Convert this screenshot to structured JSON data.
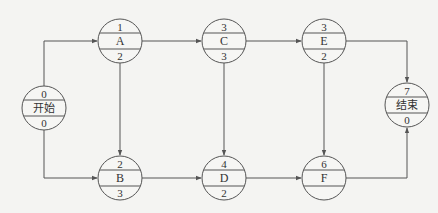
{
  "diagram": {
    "type": "activity-on-node network",
    "nodes": [
      {
        "id": "start",
        "label": "开始",
        "top": "0",
        "bottom": "0",
        "cx": 44,
        "cy": 108
      },
      {
        "id": "A",
        "label": "A",
        "top": "1",
        "bottom": "2",
        "cx": 120,
        "cy": 41
      },
      {
        "id": "B",
        "label": "B",
        "top": "2",
        "bottom": "3",
        "cx": 120,
        "cy": 178
      },
      {
        "id": "C",
        "label": "C",
        "top": "3",
        "bottom": "3",
        "cx": 224,
        "cy": 41
      },
      {
        "id": "D",
        "label": "D",
        "top": "4",
        "bottom": "2",
        "cx": 224,
        "cy": 178
      },
      {
        "id": "E",
        "label": "E",
        "top": "3",
        "bottom": "2",
        "cx": 324,
        "cy": 41
      },
      {
        "id": "F",
        "label": "F",
        "top": "6",
        "bottom": "",
        "cx": 324,
        "cy": 178
      },
      {
        "id": "end",
        "label": "结束",
        "top": "7",
        "bottom": "0",
        "cx": 407,
        "cy": 105
      }
    ],
    "edges": [
      {
        "from": "start",
        "to": "A"
      },
      {
        "from": "start",
        "to": "B"
      },
      {
        "from": "A",
        "to": "C"
      },
      {
        "from": "A",
        "to": "B"
      },
      {
        "from": "B",
        "to": "D"
      },
      {
        "from": "C",
        "to": "E"
      },
      {
        "from": "C",
        "to": "D"
      },
      {
        "from": "D",
        "to": "F"
      },
      {
        "from": "E",
        "to": "end"
      },
      {
        "from": "E",
        "to": "F"
      },
      {
        "from": "F",
        "to": "end"
      }
    ],
    "colors": {
      "line": "#555555",
      "background": "#f4f4f2",
      "text": "#333333"
    }
  }
}
